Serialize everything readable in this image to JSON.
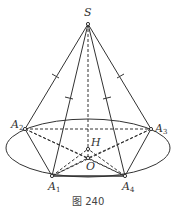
{
  "figure": {
    "caption": "图 240",
    "points": {
      "S": {
        "label": "S",
        "x": 88,
        "y": 24
      },
      "A1": {
        "label": "A",
        "sub": "1",
        "x": 52,
        "y": 176
      },
      "A2": {
        "label": "A",
        "sub": "2",
        "x": 25,
        "y": 129
      },
      "A3": {
        "label": "A",
        "sub": "3",
        "x": 151,
        "y": 129
      },
      "A4": {
        "label": "A",
        "sub": "4",
        "x": 125,
        "y": 176
      },
      "H": {
        "label": "H",
        "x": 88,
        "y": 149
      },
      "O": {
        "label": "O",
        "x": 88,
        "y": 158
      }
    },
    "base_ellipse": {
      "cx": 88,
      "cy": 148,
      "rx": 82,
      "ry": 29
    },
    "stroke_color": "#333333"
  }
}
